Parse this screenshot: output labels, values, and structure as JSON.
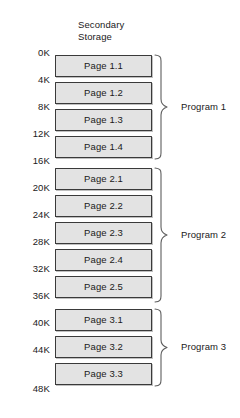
{
  "diagram": {
    "title_lines": [
      "Secondary",
      "Storage"
    ],
    "title_text": "Secondary\nStorage",
    "box_fill_color": "#e3e3e3",
    "box_border_color": "#3a3a3a",
    "brace_color": "#5e5e5e",
    "background_color": "#ffffff",
    "address_labels": [
      "0K",
      "4K",
      "8K",
      "12K",
      "16K",
      "20K",
      "24K",
      "28K",
      "32K",
      "36K",
      "40K",
      "44K",
      "48K"
    ],
    "pages": [
      {
        "label": "Page 1.1"
      },
      {
        "label": "Page 1.2"
      },
      {
        "label": "Page 1.3"
      },
      {
        "label": "Page 1.4"
      },
      {
        "label": "Page 2.1"
      },
      {
        "label": "Page 2.2"
      },
      {
        "label": "Page 2.3"
      },
      {
        "label": "Page 2.4"
      },
      {
        "label": "Page 2.5"
      },
      {
        "label": "Page 3.1"
      },
      {
        "label": "Page 3.2"
      },
      {
        "label": "Page 3.3"
      }
    ],
    "programs": [
      {
        "label": "Program 1",
        "page_count": 4,
        "first_page": "Page 1.1",
        "last_page": "Page 1.4",
        "start_address": "0K",
        "end_address": "16K"
      },
      {
        "label": "Program 2",
        "page_count": 5,
        "first_page": "Page 2.1",
        "last_page": "Page 2.5",
        "start_address": "16K",
        "end_address": "36K"
      },
      {
        "label": "Program 3",
        "page_count": 3,
        "first_page": "Page 3.1",
        "last_page": "Page 3.3",
        "start_address": "36K",
        "end_address": "48K"
      }
    ]
  }
}
